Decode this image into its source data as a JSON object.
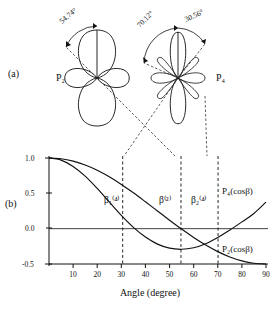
{
  "figure": {
    "panels": [
      {
        "key": "a",
        "label": "(a)"
      },
      {
        "key": "b",
        "label": "(b)"
      }
    ]
  },
  "polar": {
    "plots": [
      {
        "name": "P2",
        "label": "P₂",
        "angle_label": "54.74°",
        "angle_value": 54.74
      },
      {
        "name": "P4",
        "label": "P₄",
        "angle_label_left": "70.12°",
        "angle_left_value": 70.12,
        "angle_label_right": "30.56°",
        "angle_right_value": 30.56
      }
    ]
  },
  "chart_data": {
    "type": "line",
    "title": "",
    "xlabel": "Angle (degree)",
    "ylabel": "",
    "xlim": [
      0,
      90
    ],
    "ylim": [
      -0.5,
      1.0
    ],
    "grid": false,
    "legend_position": "inline-right",
    "xticks": [
      10,
      20,
      30,
      40,
      50,
      60,
      70,
      80,
      90
    ],
    "xticklabels": [
      "10",
      "20",
      "30",
      "40",
      "50",
      "60",
      "70",
      "80",
      "90"
    ],
    "yticks": [
      1.0,
      0.5,
      0.0,
      -0.5
    ],
    "yticklabels": [
      "1.0",
      "0.5",
      "0.0",
      "-0.5"
    ],
    "series": [
      {
        "name": "P2(cosβ)",
        "label": "P₂(cosβ)",
        "x": [
          0,
          5,
          10,
          15,
          20,
          25,
          30,
          35,
          40,
          45,
          50,
          55,
          60,
          65,
          70,
          75,
          80,
          85,
          90
        ],
        "values": [
          1.0,
          0.989,
          0.955,
          0.9,
          0.826,
          0.733,
          0.625,
          0.507,
          0.38,
          0.25,
          0.12,
          -0.006,
          -0.125,
          -0.232,
          -0.325,
          -0.4,
          -0.455,
          -0.489,
          -0.5
        ]
      },
      {
        "name": "P4(cosβ)",
        "label": "P₄(cosβ)",
        "x": [
          0,
          5,
          10,
          15,
          20,
          25,
          30,
          35,
          40,
          45,
          50,
          55,
          60,
          65,
          70,
          75,
          80,
          85,
          90
        ],
        "values": [
          1.0,
          0.97,
          0.881,
          0.744,
          0.57,
          0.378,
          0.188,
          0.018,
          -0.119,
          -0.219,
          -0.276,
          -0.292,
          -0.27,
          -0.213,
          -0.125,
          -0.02,
          0.096,
          0.215,
          0.375
        ]
      }
    ],
    "annotations": [
      {
        "name": "beta1_4",
        "label": "β₁⁽⁴⁾",
        "x": 30.56,
        "text_x": 30.56
      },
      {
        "name": "beta_2",
        "label": "β⁽²⁾",
        "x": 54.74,
        "text_x": 54.74
      },
      {
        "name": "beta2_4",
        "label": "β₂⁽⁴⁾",
        "x": 70.12,
        "text_x": 70.12
      }
    ],
    "vertical_markers": [
      30.56,
      54.74,
      70.12
    ],
    "zero_line": 0.0
  },
  "colors": {
    "curve": "#111111",
    "axis": "#111111",
    "dashed": "#333333",
    "background": "#ffffff"
  }
}
